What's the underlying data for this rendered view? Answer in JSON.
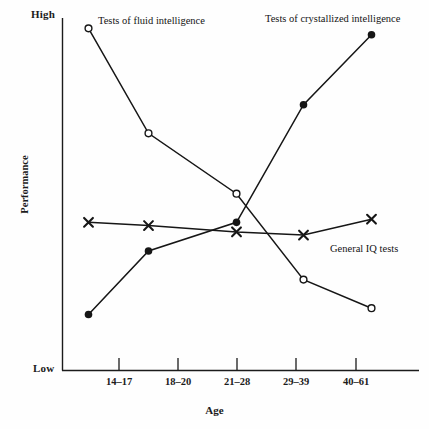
{
  "figure": {
    "background_color": "#fefefe",
    "line_color": "#161616",
    "clipped_title_fragment": "Fluid and crystallized intelligence"
  },
  "axes": {
    "y_title": "Performance",
    "y_high_label": "High",
    "y_low_label": "Low",
    "x_title": "Age",
    "x_tick_labels": [
      "14–17",
      "18–20",
      "21–28",
      "29–39",
      "40–61"
    ]
  },
  "annotations": {
    "fluid_label": "Tests of fluid intelligence",
    "crystallized_label": "Tests of crystallized intelligence",
    "iq_label": "General IQ tests"
  },
  "chart_data": {
    "type": "line",
    "title": "Fluid and crystallized intelligence",
    "xlabel": "Age",
    "ylabel": "Performance",
    "categories": [
      "14–17",
      "18–20",
      "21–28",
      "29–39",
      "40–61"
    ],
    "ylim": [
      0,
      100
    ],
    "ytick_labels": [
      "Low",
      "High"
    ],
    "grid": false,
    "legend": "inline-annotations",
    "series": [
      {
        "name": "Tests of fluid intelligence",
        "marker": "open-circle",
        "values": [
          98,
          65,
          46,
          19,
          10
        ]
      },
      {
        "name": "Tests of crystallized intelligence",
        "marker": "filled-circle",
        "values": [
          8,
          28,
          37,
          74,
          96
        ]
      },
      {
        "name": "General IQ tests",
        "marker": "cross-x",
        "values": [
          37,
          36,
          34,
          33,
          38
        ]
      }
    ]
  }
}
